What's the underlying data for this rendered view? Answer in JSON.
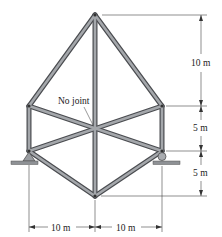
{
  "diagram": {
    "type": "truss",
    "annotation": {
      "text": "No joint"
    },
    "dimensions": {
      "vertical": [
        {
          "label": "10 m",
          "from": "apex",
          "to": "upper-joints"
        },
        {
          "label": "5 m",
          "from": "upper-joints",
          "to": "support-joints"
        },
        {
          "label": "5 m",
          "from": "support-joints",
          "to": "bottom-apex"
        }
      ],
      "horizontal": [
        {
          "label": "10 m",
          "from": "left-support",
          "to": "center"
        },
        {
          "label": "10 m",
          "from": "center",
          "to": "right-support"
        }
      ]
    },
    "supports": [
      {
        "side": "left",
        "kind": "pin"
      },
      {
        "side": "right",
        "kind": "roller"
      }
    ],
    "colors": {
      "member": "#8a8d91",
      "member_edge": "#4a4c50",
      "line": "#333333"
    }
  }
}
